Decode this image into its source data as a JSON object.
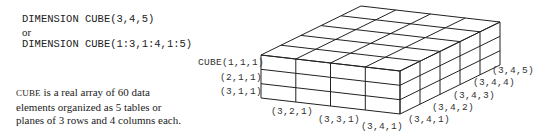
{
  "code": {
    "line1": "DIMENSION CUBE(3,4,5)",
    "or": "or",
    "line2": "DIMENSION CUBE(1:3,1:4,1:5)"
  },
  "description": {
    "name": "CUBE",
    "text": " is a real array of 60 data elements organized as 5 tables or planes of 3 rows and 4 columns each."
  },
  "diagram": {
    "rows": 3,
    "columns": 4,
    "planes": 5,
    "line_color": "#222222",
    "labels": {
      "row1": "CUBE(1,1,1)",
      "row2": "(2,1,1)",
      "row3": "(3,1,1)",
      "col2": "(3,2,1)",
      "col3": "(3,3,1)",
      "col4": "(3,4,1)",
      "plane1": "(3,4,1)",
      "plane2": "(3,4,2)",
      "plane3": "(3,4,3)",
      "plane4": "(3,4,4)",
      "plane5": "(3,4,5)"
    }
  }
}
